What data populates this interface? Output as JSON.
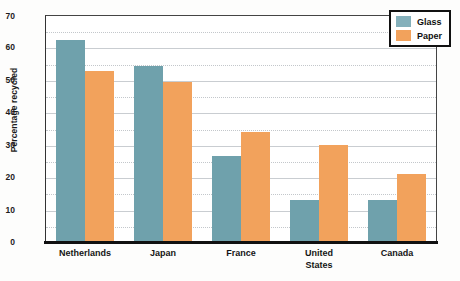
{
  "chart_data": {
    "type": "bar",
    "title": "",
    "xlabel": "",
    "ylabel": "Percentage recycled",
    "ylim": [
      0,
      70
    ],
    "ytick_step": 10,
    "minor_gridline_step": 5,
    "grid": true,
    "legend_position": "top-right",
    "categories": [
      "Netherlands",
      "Japan",
      "France",
      "United States",
      "Canada"
    ],
    "series": [
      {
        "name": "Glass",
        "color": "#6fa1ac",
        "values": [
          62.5,
          54.5,
          26.5,
          13,
          13
        ]
      },
      {
        "name": "Paper",
        "color": "#f2a25c",
        "values": [
          53,
          49.5,
          34,
          30,
          21
        ]
      }
    ],
    "yticks": [
      "0",
      "10",
      "20",
      "30",
      "40",
      "50",
      "60",
      "70"
    ]
  },
  "legend": {
    "items": [
      {
        "label": "Glass",
        "swatch": "glass-swatch"
      },
      {
        "label": "Paper",
        "swatch": "paper-swatch"
      }
    ]
  },
  "axis": {
    "y_title": "Percentage recycled",
    "y_labels": {
      "t0": "0",
      "t10": "10",
      "t20": "20",
      "t30": "30",
      "t40": "40",
      "t50": "50",
      "t60": "60",
      "t70": "70"
    },
    "x_labels": {
      "c0": "Netherlands",
      "c1": "Japan",
      "c2": "France",
      "c3a": "United",
      "c3b": "States",
      "c4": "Canada"
    }
  },
  "colors": {
    "glass": "#6fa1ac",
    "paper": "#f2a25c",
    "frame": "#333333",
    "grid_major": "#c9cdd1",
    "grid_minor": "#c3c7cb"
  }
}
